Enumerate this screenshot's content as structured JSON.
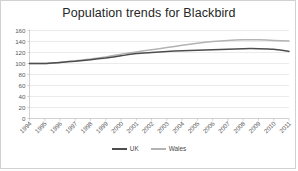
{
  "chart_data": {
    "type": "line",
    "title": "Population trends for Blackbird",
    "xlabel": "",
    "ylabel": "",
    "ylim": [
      0,
      160
    ],
    "yticks": [
      0,
      20,
      40,
      60,
      80,
      100,
      120,
      140,
      160
    ],
    "grid": true,
    "legend_position": "bottom",
    "categories": [
      "1994",
      "1995",
      "1996",
      "1997",
      "1998",
      "1999",
      "2000",
      "2001",
      "2002",
      "2003",
      "2004",
      "2005",
      "2006",
      "2007",
      "2008",
      "2009",
      "2010",
      "2011"
    ],
    "series": [
      {
        "name": "UK",
        "color": "#4d4d4d",
        "values": [
          100,
          100,
          102,
          104,
          107,
          110,
          114,
          118,
          120,
          122,
          123,
          124,
          125,
          126,
          127,
          127,
          126,
          122
        ]
      },
      {
        "name": "Wales",
        "color": "#b3b3b3",
        "values": [
          100,
          100,
          102,
          105,
          108,
          112,
          117,
          121,
          125,
          129,
          133,
          137,
          140,
          142,
          143,
          143,
          142,
          141
        ]
      }
    ]
  },
  "legend": {
    "entries": [
      {
        "label": "UK"
      },
      {
        "label": "Wales"
      }
    ]
  },
  "colors": {
    "uk_line": "#4d4d4d",
    "wales_line": "#b3b3b3",
    "gridline": "#e2e2e2",
    "axis": "#bfbfbf",
    "title_text": "#262626",
    "tick_text": "#5a5a5a",
    "card_border": "#d2d2d2",
    "background": "#ffffff"
  }
}
